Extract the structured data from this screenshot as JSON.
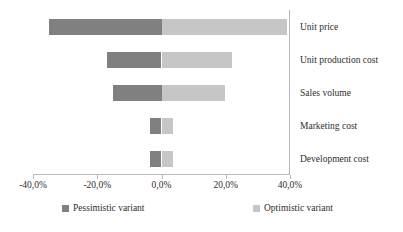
{
  "chart_data": {
    "type": "bar",
    "subtype": "tornado-diverging-horizontal",
    "title": "",
    "xlabel": "",
    "ylabel": "",
    "orientation": "horizontal",
    "grid": false,
    "legend_position": "bottom",
    "xlim": [
      -40,
      40
    ],
    "xticks": [
      -40,
      -20,
      0,
      20,
      40
    ],
    "xtick_labels": [
      "-40,0%",
      "-20,0%",
      "0,0%",
      "20,0%",
      "40,0%"
    ],
    "categories": [
      "Unit price",
      "Unit production cost",
      "Sales volume",
      "Marketing cost",
      "Development cost"
    ],
    "series": [
      {
        "name": "Pessimistic variant",
        "color": "#808080",
        "values": [
          -35.0,
          -17.0,
          -15.0,
          -3.5,
          -3.5
        ]
      },
      {
        "name": "Optimistic variant",
        "color": "#c6c6c6",
        "values": [
          39.0,
          22.0,
          19.7,
          3.5,
          3.5
        ]
      }
    ]
  },
  "legend": {
    "items": [
      {
        "label": "Pessimistic variant",
        "color": "#808080"
      },
      {
        "label": "Optimistic variant",
        "color": "#c6c6c6"
      }
    ]
  }
}
